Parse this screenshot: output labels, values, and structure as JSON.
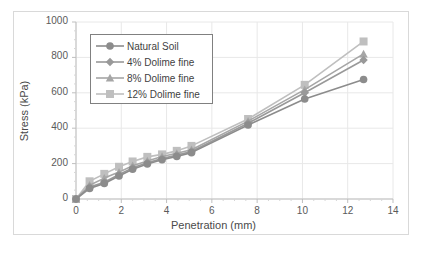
{
  "chart_data": {
    "type": "line",
    "title": "",
    "xlabel": "Penetration (mm)",
    "ylabel": "Stress (kPa)",
    "xlim": [
      0,
      14
    ],
    "ylim": [
      0,
      1000
    ],
    "xticks": [
      0,
      2,
      4,
      6,
      8,
      10,
      12,
      14
    ],
    "yticks": [
      0,
      200,
      400,
      600,
      800,
      1000
    ],
    "grid": true,
    "legend_position": "upper-left-inside",
    "series": [
      {
        "name": "Natural Soil",
        "marker": "circle",
        "color": "#8c8c8c",
        "x": [
          0,
          0.6,
          1.25,
          1.9,
          2.5,
          3.15,
          3.8,
          4.45,
          5.1,
          7.6,
          10.1,
          12.7
        ],
        "y": [
          0,
          60,
          88,
          130,
          168,
          198,
          222,
          240,
          262,
          418,
          565,
          675
        ]
      },
      {
        "name": "4% Dolime fine",
        "marker": "diamond",
        "color": "#999999",
        "x": [
          0,
          0.6,
          1.25,
          1.9,
          2.5,
          3.15,
          3.8,
          4.45,
          5.1,
          7.6,
          10.1,
          12.7
        ],
        "y": [
          0,
          68,
          95,
          138,
          176,
          205,
          228,
          248,
          268,
          428,
          600,
          785
        ]
      },
      {
        "name": "8% Dolime fine",
        "marker": "triangle",
        "color": "#a6a6a6",
        "x": [
          0,
          0.6,
          1.25,
          1.9,
          2.5,
          3.15,
          3.8,
          4.45,
          5.1,
          7.6,
          10.1,
          12.7
        ],
        "y": [
          0,
          78,
          118,
          152,
          188,
          215,
          240,
          258,
          278,
          440,
          618,
          820
        ]
      },
      {
        "name": "12% Dolime fine",
        "marker": "square",
        "color": "#bfbfbf",
        "x": [
          0,
          0.6,
          1.25,
          1.9,
          2.5,
          3.15,
          3.8,
          4.45,
          5.1,
          7.6,
          10.1,
          12.7
        ],
        "y": [
          0,
          100,
          142,
          182,
          212,
          238,
          252,
          272,
          300,
          452,
          645,
          890
        ]
      }
    ]
  },
  "legend": {
    "items": [
      {
        "label": "Natural Soil"
      },
      {
        "label": "4% Dolime fine"
      },
      {
        "label": "8% Dolime fine"
      },
      {
        "label": "12% Dolime fine"
      }
    ]
  },
  "axes": {
    "x_title": "Penetration (mm)",
    "y_title": "Stress (kPa)",
    "x_tick_labels": [
      "0",
      "2",
      "4",
      "6",
      "8",
      "10",
      "12",
      "14"
    ],
    "y_tick_labels": [
      "0",
      "200",
      "400",
      "600",
      "800",
      "1000"
    ]
  },
  "colors": {
    "grid": "#e8e8e8",
    "axis": "#bfbfbf",
    "text": "#4a4a4a",
    "figure_border": "#d9d9d9",
    "legend_border": "#808080"
  }
}
